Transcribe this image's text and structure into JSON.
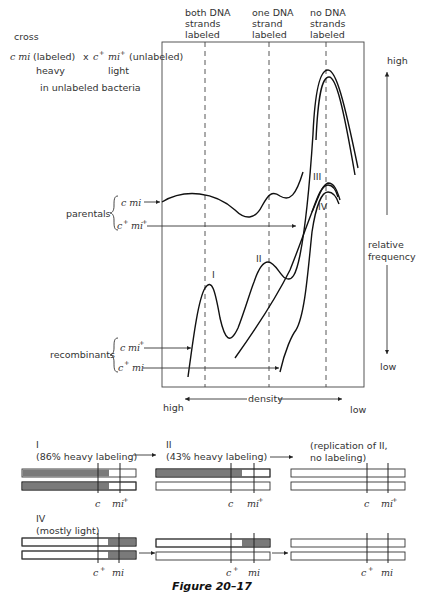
{
  "header": {
    "cross": "cross",
    "cross_line": {
      "p1": "c mi",
      "p1_note": "(labeled)",
      "times": "x",
      "p2_c": "c",
      "p2_mi": "mi",
      "plus": "+",
      "p2_note": "(unlabeled)"
    },
    "heavy": "heavy",
    "light": "light",
    "context": "in unlabeled bacteria"
  },
  "column_labels": [
    {
      "l1": "both DNA",
      "l2": "strands",
      "l3": "labeled"
    },
    {
      "l1": "one DNA",
      "l2": "strand",
      "l3": "labeled"
    },
    {
      "l1": "no DNA",
      "l2": "strands",
      "l3": "labeled"
    }
  ],
  "y_axis": {
    "high": "high",
    "low": "low",
    "label_1": "relative",
    "label_2": "frequency"
  },
  "x_axis": {
    "label": "density",
    "left": "high",
    "right": "low"
  },
  "parentals": {
    "label": "parentals",
    "g1": "c mi",
    "g2_c": "c",
    "g2_mi": "mi",
    "plus": "+"
  },
  "recombinants": {
    "label": "recombinants",
    "g1_c": "c",
    "g1_mi": "mi",
    "g2_c": "c",
    "g2_mi": "mi",
    "plus": "+"
  },
  "peak_labels": [
    "I",
    "II",
    "III",
    "IV"
  ],
  "panels": [
    {
      "roman": "I",
      "desc": "(86% heavy labeling)",
      "m1": "c",
      "m2": "mi",
      "m2_sup": "+"
    },
    {
      "roman": "II",
      "desc": "(43% heavy labeling)",
      "m1": "c",
      "m2": "mi",
      "m2_sup": "+"
    },
    {
      "roman": "",
      "desc_1": "(replication of II,",
      "desc_2": "no labeling)",
      "m1": "c",
      "m2": "mi",
      "m2_sup": "+"
    },
    {
      "roman": "IV",
      "desc": "(mostly light)",
      "m1": "c",
      "m1_sup": "+",
      "m2": "mi"
    },
    {
      "m1": "c",
      "m1_sup": "+",
      "m2": "mi"
    },
    {
      "m1": "c",
      "m1_sup": "+",
      "m2": "mi"
    }
  ],
  "caption": "Figure 20–17"
}
